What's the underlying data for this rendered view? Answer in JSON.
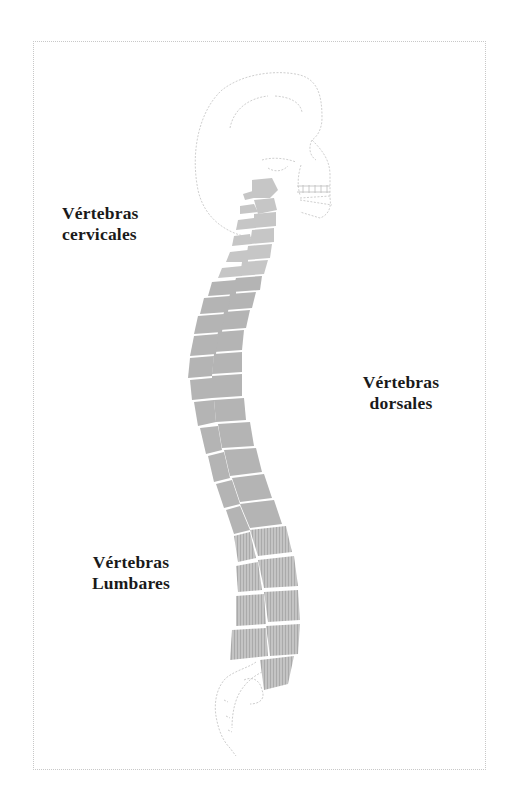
{
  "diagram": {
    "colors": {
      "vertebra_fill": "#b4b4b4",
      "vertebra_light": "#c6c6c6",
      "outline": "#cfcfcf",
      "label_text": "#1a1a1a",
      "frame_border": "#c8c8c8"
    },
    "labels": {
      "cervical": {
        "line1": "Vértebras",
        "line2": "cervicales"
      },
      "dorsal": {
        "line1": "Vértebras",
        "line2": "dorsales"
      },
      "lumbar": {
        "line1": "Vértebras",
        "line2": "Lumbares"
      }
    }
  }
}
